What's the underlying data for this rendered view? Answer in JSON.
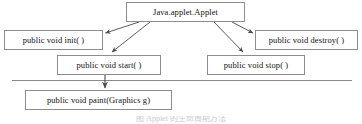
{
  "figure": {
    "background_color": "#ffffff",
    "border_color": "#8d8d8d",
    "text_color": "#111111",
    "line_color": "#5a5a5a"
  },
  "nodes": {
    "root": "Java.applet.Applet",
    "init": "public void init( )",
    "destroy": "public void destroy( )",
    "start": "public void start( )",
    "stop": "public void stop( )",
    "paint": "public void paint(Graphics g)"
  },
  "separator": {
    "name": "horizontal-divider",
    "x_start": 12,
    "x_end": 352,
    "y": 80
  },
  "connectors": [
    {
      "name": "arrow-root-to-init",
      "from": "root",
      "to": "init",
      "style": "arrow"
    },
    {
      "name": "arrow-root-to-start",
      "from": "root",
      "to": "start",
      "style": "arrow"
    },
    {
      "name": "arrow-root-to-destroy",
      "from": "root",
      "to": "destroy",
      "style": "arrow"
    },
    {
      "name": "arrow-root-to-stop",
      "from": "root",
      "to": "stop",
      "style": "arrow"
    },
    {
      "name": "arrow-start-to-paint",
      "from": "start",
      "to": "paint",
      "style": "arrow"
    }
  ],
  "caption": {
    "text": "图  Applet 的生命周期方法",
    "truncated": true
  }
}
